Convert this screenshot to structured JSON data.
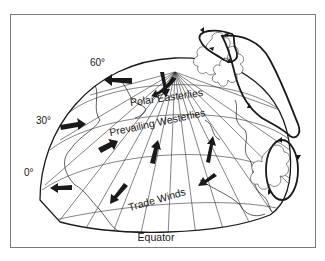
{
  "diagram": {
    "latitude_labels": [
      {
        "text": "60°",
        "x": 90,
        "y": 66
      },
      {
        "text": "30°",
        "x": 36,
        "y": 124
      },
      {
        "text": "0°",
        "x": 24,
        "y": 176
      }
    ],
    "wind_belt_labels": [
      {
        "text": "Polar Easterlies",
        "x": 167,
        "y": 101,
        "rotate": -8
      },
      {
        "text": "Prevailing Westerlies",
        "x": 158,
        "y": 126,
        "rotate": -12
      },
      {
        "text": "Trade Winds",
        "x": 158,
        "y": 203,
        "rotate": -16
      }
    ],
    "equator_label": {
      "text": "Equator",
      "x": 156,
      "y": 241
    },
    "cells": [
      "polar cell",
      "ferrel cell",
      "hadley cell"
    ],
    "colors": {
      "ink": "#1a1a1a",
      "frame": "#7a7a7a",
      "background": "#ffffff"
    }
  }
}
